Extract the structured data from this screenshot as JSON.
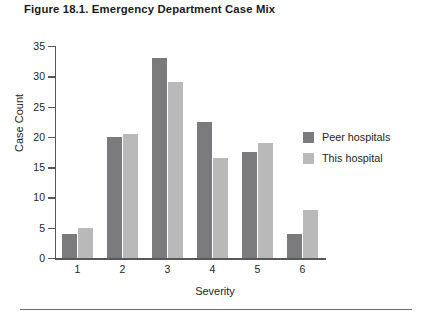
{
  "figure": {
    "title": "Figure 18.1. Emergency Department Case Mix"
  },
  "colors": {
    "peer_hospitals": "#7b7b7d",
    "this_hospital": "#b9b9ba",
    "axis": "#58585a",
    "text": "#231f20"
  },
  "legend": {
    "position": "inside-right",
    "items": [
      {
        "label": "Peer hospitals",
        "color": "#7b7b7d"
      },
      {
        "label": "This hospital",
        "color": "#b9b9ba"
      }
    ]
  },
  "chart_data": {
    "type": "bar",
    "title": "Figure 18.1. Emergency Department Case Mix",
    "xlabel": "Severity",
    "ylabel": "Case Count",
    "categories": [
      "1",
      "2",
      "3",
      "4",
      "5",
      "6"
    ],
    "series": [
      {
        "name": "Peer hospitals",
        "values": [
          4,
          20,
          33,
          22.5,
          17.5,
          4
        ]
      },
      {
        "name": "This hospital",
        "values": [
          5,
          20.5,
          29,
          16.5,
          19,
          8
        ]
      }
    ],
    "ylim": [
      0,
      35
    ],
    "yticks": [
      0,
      5,
      10,
      15,
      20,
      25,
      30,
      35
    ],
    "ytick_labels": [
      "0",
      "5",
      "10",
      "15",
      "20",
      "25",
      "30",
      "35"
    ],
    "xtick_labels": [
      "1",
      "2",
      "3",
      "4",
      "5",
      "6"
    ],
    "grid": false,
    "legend_position": "inside-right"
  }
}
